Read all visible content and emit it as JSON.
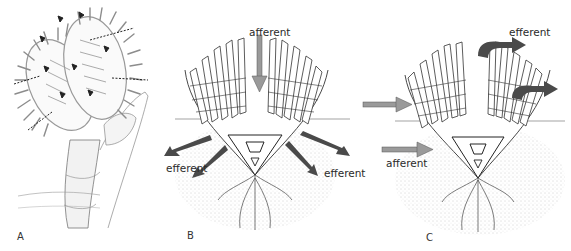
{
  "figure": {
    "panels": [
      {
        "id": "A",
        "letter": "A",
        "description": "Lophophore of a phoronid on its tube, tentacles with small flow arrows"
      },
      {
        "id": "B",
        "letter": "B",
        "description": "Lophophore in sediment, central afferent flow downwards, lateral efferent flows",
        "labels": {
          "afferent": "afferent",
          "efferent_left": "efferent",
          "efferent_right": "efferent"
        }
      },
      {
        "id": "C",
        "letter": "C",
        "description": "Lophophore in sediment, lateral afferent flows entering, efferent flows exiting top right",
        "labels": {
          "efferent": "efferent",
          "afferent": "afferent"
        }
      }
    ],
    "colors": {
      "afferent_arrow": "#9a9a9a",
      "efferent_arrow": "#4a4a4a",
      "line": "#333333",
      "sediment": "#b8b8b8"
    }
  }
}
